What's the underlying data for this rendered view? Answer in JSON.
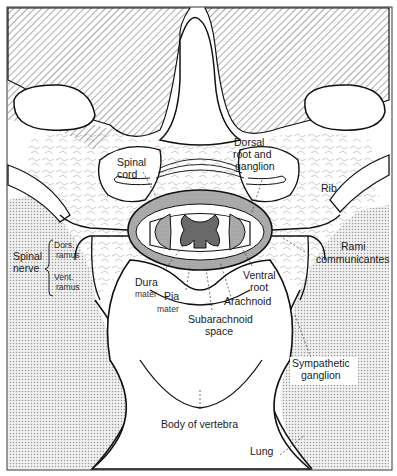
{
  "diagram": {
    "type": "anatomical cross-section",
    "colors": {
      "ink": "#1a1a1a",
      "background": "#ffffff",
      "lung_stipple": "#c8c8c8",
      "muscle_hatch": "#555555",
      "grey_matter": "#8a8a8a"
    },
    "labels": {
      "spinal_cord": [
        "Spinal",
        "cord"
      ],
      "dorsal_root": [
        "Dorsal",
        "root  and",
        "ganglion"
      ],
      "rib": "Rib",
      "spinal_nerve": [
        "Spinal",
        "nerve"
      ],
      "dors_ramus": [
        "Dors.",
        "ramus"
      ],
      "vent_ramus": [
        "Vent.",
        "ramus"
      ],
      "rami_communicantes": [
        "Rami",
        "communicantes"
      ],
      "dura_mater": [
        "Dura",
        "mater"
      ],
      "pia_mater": [
        "Pia",
        "mater"
      ],
      "ventral_root": [
        "Ventral",
        "root"
      ],
      "arachnoid": "Arachnoid",
      "subarachnoid_space": [
        "Subarachnoid",
        "space"
      ],
      "sympathetic_ganglion": [
        "Sympathetic",
        "ganglion"
      ],
      "body_of_vertebra": "Body of vertebra",
      "lung": "Lung"
    }
  }
}
